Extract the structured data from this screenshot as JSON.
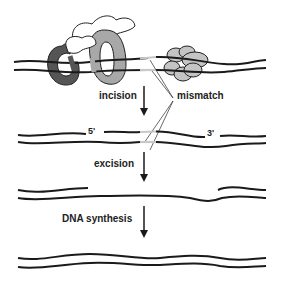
{
  "diagram": {
    "steps": [
      {
        "label": "incision"
      },
      {
        "label": "excision"
      },
      {
        "label": "DNA synthesis"
      }
    ],
    "callout": "mismatch",
    "strand_ends": {
      "five_prime": "5'",
      "three_prime": "3'"
    },
    "colors": {
      "strand": "#1a1a1a",
      "mismatch": "#c8c8c8",
      "protein_dark": "#555555",
      "protein_mid": "#a8a8a8",
      "protein_light": "#ffffff",
      "protein_small": "#c4c4c4"
    }
  }
}
